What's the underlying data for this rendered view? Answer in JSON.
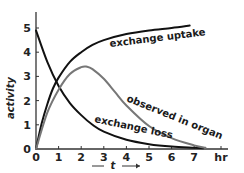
{
  "chart_data": {
    "type": "line",
    "title": "",
    "xlabel": "t",
    "xunit": "hr",
    "ylabel": "activity",
    "xlim": [
      0,
      7.6
    ],
    "ylim": [
      0,
      5.6
    ],
    "xticks": [
      "0",
      "1",
      "2",
      "3",
      "4",
      "5",
      "6",
      "7"
    ],
    "yticks": [
      "0",
      "1",
      "2",
      "3",
      "4",
      "5"
    ],
    "grid": false,
    "legend": "inline curve labels",
    "series": [
      {
        "name": "exchange uptake",
        "color": "#111111",
        "x": [
          0,
          0.25,
          0.5,
          0.75,
          1,
          1.5,
          2,
          2.5,
          3,
          4,
          5,
          6,
          6.8
        ],
        "y": [
          0,
          1.05,
          1.85,
          2.5,
          2.95,
          3.6,
          4.0,
          4.3,
          4.5,
          4.75,
          4.9,
          5.0,
          5.1
        ]
      },
      {
        "name": "exchange loss",
        "color": "#111111",
        "x": [
          0,
          0.5,
          1,
          1.5,
          2,
          2.5,
          3,
          4,
          5,
          6,
          7,
          7.4
        ],
        "y": [
          4.9,
          3.6,
          2.6,
          1.9,
          1.4,
          1.0,
          0.72,
          0.38,
          0.2,
          0.1,
          0.05,
          0.03
        ]
      },
      {
        "name": "observed in organ",
        "color": "#777777",
        "x": [
          0,
          0.5,
          1,
          1.5,
          2,
          2.25,
          2.5,
          3,
          3.5,
          4,
          5,
          6,
          7,
          7.5
        ],
        "y": [
          0,
          1.5,
          2.45,
          3.1,
          3.38,
          3.4,
          3.3,
          2.9,
          2.35,
          1.8,
          0.95,
          0.45,
          0.15,
          0.05
        ]
      }
    ],
    "annotations": [
      "t →"
    ]
  }
}
